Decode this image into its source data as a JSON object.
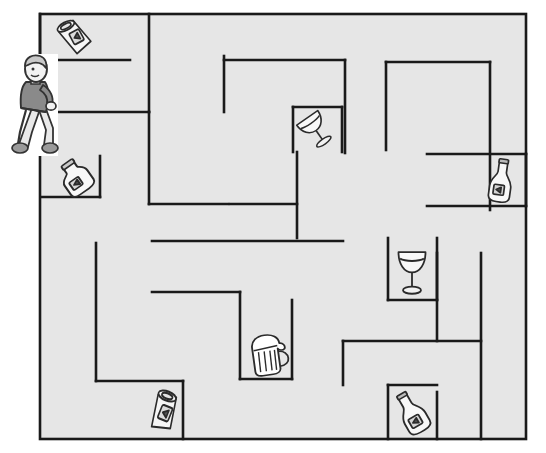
{
  "scene": {
    "title": "Drinks Maze Puzzle",
    "width": 546,
    "height": 453,
    "background_color": "#ffffff",
    "maze_fill_color": "#e6e6e6",
    "wall_color": "#1a1a1a",
    "wall_thickness": 2.6
  },
  "maze": {
    "border": {
      "x": 40,
      "y": 14,
      "width": 486,
      "height": 425
    },
    "walls": [
      {
        "id": "w01",
        "name": "top-left-can-alcove-vertical",
        "x1": 40,
        "y1": 14,
        "x2": 40,
        "y2": 56
      },
      {
        "id": "w02",
        "name": "can-alcove-bottom",
        "x1": 40,
        "y1": 60,
        "x2": 130,
        "y2": 60
      },
      {
        "id": "w03",
        "name": "top-stub-vertical-1",
        "x1": 149,
        "y1": 14,
        "x2": 149,
        "y2": 112
      },
      {
        "id": "w04",
        "name": "upper-mid-horizontal-1",
        "x1": 149,
        "y1": 112,
        "x2": 42,
        "y2": 112
      },
      {
        "id": "w05",
        "name": "top-vertical-long",
        "x1": 224,
        "y1": 56,
        "x2": 224,
        "y2": 112
      },
      {
        "id": "w06",
        "name": "center-top-horizontal",
        "x1": 224,
        "y1": 60,
        "x2": 345,
        "y2": 60
      },
      {
        "id": "w07",
        "name": "center-vertical-down",
        "x1": 345,
        "y1": 60,
        "x2": 345,
        "y2": 153
      },
      {
        "id": "w08",
        "name": "right-upper-horizontal",
        "x1": 386,
        "y1": 62,
        "x2": 490,
        "y2": 62
      },
      {
        "id": "w09",
        "name": "right-upper-vertical",
        "x1": 386,
        "y1": 62,
        "x2": 386,
        "y2": 150
      },
      {
        "id": "w10",
        "name": "far-right-vertical",
        "x1": 490,
        "y1": 62,
        "x2": 490,
        "y2": 210
      },
      {
        "id": "w11",
        "name": "glass-alcove-left",
        "x1": 293,
        "y1": 107,
        "x2": 293,
        "y2": 152
      },
      {
        "id": "w12",
        "name": "glass-alcove-right",
        "x1": 342,
        "y1": 107,
        "x2": 342,
        "y2": 152
      },
      {
        "id": "w13",
        "name": "glass-alcove-top",
        "x1": 293,
        "y1": 107,
        "x2": 342,
        "y2": 107
      },
      {
        "id": "w14",
        "name": "right-pocket-horizontal",
        "x1": 427,
        "y1": 154,
        "x2": 526,
        "y2": 154
      },
      {
        "id": "w15",
        "name": "right-pocket-bottom",
        "x1": 427,
        "y1": 206,
        "x2": 526,
        "y2": 206
      },
      {
        "id": "w16",
        "name": "mid-left-L-vertical",
        "x1": 149,
        "y1": 112,
        "x2": 149,
        "y2": 204
      },
      {
        "id": "w17",
        "name": "bottle-alcove-vertical",
        "x1": 100,
        "y1": 156,
        "x2": 100,
        "y2": 197
      },
      {
        "id": "w18",
        "name": "bottle-alcove-bottom",
        "x1": 42,
        "y1": 197,
        "x2": 100,
        "y2": 197
      },
      {
        "id": "w19",
        "name": "mid-left-horizontal",
        "x1": 149,
        "y1": 204,
        "x2": 228,
        "y2": 204
      },
      {
        "id": "w20",
        "name": "mid-horizontal-upper",
        "x1": 230,
        "y1": 204,
        "x2": 297,
        "y2": 204
      },
      {
        "id": "w21",
        "name": "center-long-vertical",
        "x1": 297,
        "y1": 152,
        "x2": 297,
        "y2": 238
      },
      {
        "id": "w22",
        "name": "center-mid-horizontal",
        "x1": 152,
        "y1": 241,
        "x2": 343,
        "y2": 241
      },
      {
        "id": "w23",
        "name": "left-vertical-lower",
        "x1": 96,
        "y1": 243,
        "x2": 96,
        "y2": 381
      },
      {
        "id": "w24",
        "name": "beer-shelf-horizontal",
        "x1": 152,
        "y1": 292,
        "x2": 240,
        "y2": 292
      },
      {
        "id": "w25",
        "name": "beer-alcove-left",
        "x1": 240,
        "y1": 292,
        "x2": 240,
        "y2": 379
      },
      {
        "id": "w26",
        "name": "beer-alcove-bottom",
        "x1": 240,
        "y1": 379,
        "x2": 292,
        "y2": 379
      },
      {
        "id": "w27",
        "name": "beer-alcove-right",
        "x1": 292,
        "y1": 300,
        "x2": 292,
        "y2": 379
      },
      {
        "id": "w28",
        "name": "wineglass-alcove-left",
        "x1": 388,
        "y1": 238,
        "x2": 388,
        "y2": 300
      },
      {
        "id": "w29",
        "name": "wineglass-alcove-right",
        "x1": 437,
        "y1": 238,
        "x2": 437,
        "y2": 300
      },
      {
        "id": "w30",
        "name": "wineglass-alcove-bottom",
        "x1": 388,
        "y1": 300,
        "x2": 437,
        "y2": 300
      },
      {
        "id": "w31",
        "name": "right-lower-vertical",
        "x1": 481,
        "y1": 253,
        "x2": 481,
        "y2": 439
      },
      {
        "id": "w32",
        "name": "lower-right-horizontal",
        "x1": 343,
        "y1": 341,
        "x2": 481,
        "y2": 341
      },
      {
        "id": "w33",
        "name": "lower-right-stub-vertical",
        "x1": 343,
        "y1": 341,
        "x2": 343,
        "y2": 385
      },
      {
        "id": "w34",
        "name": "champagne-alcove-top",
        "x1": 388,
        "y1": 385,
        "x2": 437,
        "y2": 385
      },
      {
        "id": "w35",
        "name": "champagne-alcove-left",
        "x1": 388,
        "y1": 385,
        "x2": 388,
        "y2": 439
      },
      {
        "id": "w36",
        "name": "champagne-alcove-right",
        "x1": 437,
        "y1": 392,
        "x2": 437,
        "y2": 439
      },
      {
        "id": "w37",
        "name": "bottom-can-alcove-left",
        "x1": 96,
        "y1": 381,
        "x2": 183,
        "y2": 381
      },
      {
        "id": "w38",
        "name": "bottom-can-alcove-right",
        "x1": 183,
        "y1": 381,
        "x2": 183,
        "y2": 439
      },
      {
        "id": "w39",
        "name": "mid-right-vertical-stub",
        "x1": 437,
        "y1": 253,
        "x2": 437,
        "y2": 341
      },
      {
        "id": "w40",
        "name": "upper-right-pocket-vertical",
        "x1": 526,
        "y1": 154,
        "x2": 526,
        "y2": 206
      }
    ]
  },
  "character": {
    "name": "walker",
    "label": "Person walking",
    "x": 6,
    "y": 52,
    "width": 56,
    "height": 106,
    "shirt_color": "#8a8a8a",
    "pants_color": "#e9e9e9",
    "shoe_color": "#9a9a9a",
    "hair_color": "#c8c8c8",
    "skin_color": "#f2f2f2",
    "outline_color": "#333333"
  },
  "items": [
    {
      "id": "item-can-top-left",
      "name": "soda-can-top-left",
      "type": "can",
      "label": "Can",
      "x": 56,
      "y": 18,
      "width": 38,
      "height": 38,
      "rotation": -28
    },
    {
      "id": "item-bottle-left",
      "name": "milk-bottle-left",
      "type": "bottle",
      "label": "Bottle",
      "x": 56,
      "y": 158,
      "width": 40,
      "height": 40,
      "rotation": -35
    },
    {
      "id": "item-glass-upper",
      "name": "tilted-wine-glass-upper",
      "type": "wineglass",
      "label": "Wine glass",
      "x": 298,
      "y": 110,
      "width": 34,
      "height": 38,
      "rotation": -35
    },
    {
      "id": "item-bottle-right",
      "name": "wine-bottle-right",
      "type": "winebottle",
      "label": "Wine bottle",
      "x": 483,
      "y": 158,
      "width": 36,
      "height": 46,
      "rotation": 8
    },
    {
      "id": "item-glass-lower",
      "name": "wine-glass-lower",
      "type": "wineglass",
      "label": "Wine glass",
      "x": 394,
      "y": 245,
      "width": 36,
      "height": 50,
      "rotation": 0
    },
    {
      "id": "item-beer-mug",
      "name": "beer-mug",
      "type": "beermug",
      "label": "Beer mug",
      "x": 244,
      "y": 332,
      "width": 46,
      "height": 46,
      "rotation": -8
    },
    {
      "id": "item-can-bottom",
      "name": "soda-can-bottom",
      "type": "can",
      "label": "Can",
      "x": 145,
      "y": 390,
      "width": 38,
      "height": 44,
      "rotation": 22
    },
    {
      "id": "item-champagne-bottom",
      "name": "champagne-bottle-bottom",
      "type": "winebottle",
      "label": "Champagne bottle",
      "x": 392,
      "y": 390,
      "width": 40,
      "height": 46,
      "rotation": -30
    }
  ]
}
